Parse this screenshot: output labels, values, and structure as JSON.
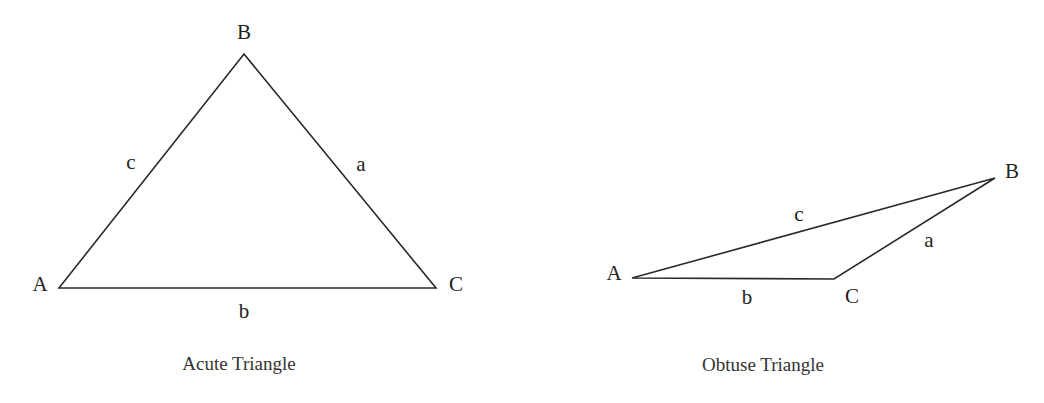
{
  "figures": [
    {
      "id": "acute",
      "caption": "Acute Triangle",
      "vertices": {
        "A": {
          "label": "A",
          "x": 59,
          "y": 288
        },
        "B": {
          "label": "B",
          "x": 244,
          "y": 54
        },
        "C": {
          "label": "C",
          "x": 436,
          "y": 288
        }
      },
      "sides": {
        "a": {
          "label": "a"
        },
        "b": {
          "label": "b"
        },
        "c": {
          "label": "c"
        }
      }
    },
    {
      "id": "obtuse",
      "caption": "Obtuse Triangle",
      "vertices": {
        "A": {
          "label": "A",
          "x": 632,
          "y": 278
        },
        "B": {
          "label": "B",
          "x": 995,
          "y": 178
        },
        "C": {
          "label": "C",
          "x": 834,
          "y": 279
        }
      },
      "sides": {
        "a": {
          "label": "a"
        },
        "b": {
          "label": "b"
        },
        "c": {
          "label": "c"
        }
      }
    }
  ],
  "colors": {
    "stroke": "#2a2a2a",
    "text": "#222222",
    "background": "#ffffff"
  }
}
